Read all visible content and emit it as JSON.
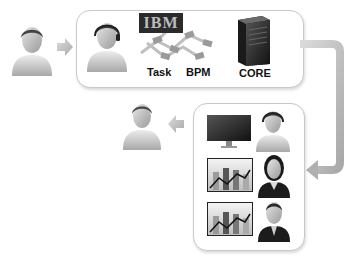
{
  "diagram": {
    "top_box": {
      "items": [
        {
          "icon": "agent-headset-icon"
        },
        {
          "icon": "ibm-bpm-icon",
          "logo_text": "IBM",
          "labels": [
            "Task",
            "BPM"
          ]
        },
        {
          "icon": "server-icon",
          "label": "CORE"
        }
      ]
    },
    "bottom_box": {
      "rows": [
        {
          "left": "monitor-icon",
          "right": "agent-headset-icon"
        },
        {
          "left": "chart-icon",
          "right": "female-headset-agent-icon"
        },
        {
          "left": "chart-icon",
          "right": "businessman-icon"
        }
      ]
    },
    "left_person": {
      "icon": "customer-icon"
    },
    "output_person": {
      "icon": "customer-icon"
    },
    "colors": {
      "box_border": "#c9c9c9",
      "arrow": "#bdbdbd",
      "text": "#111111"
    }
  },
  "labels": {
    "task": "Task",
    "bpm": "BPM",
    "core": "CORE",
    "ibm": "IBM"
  }
}
